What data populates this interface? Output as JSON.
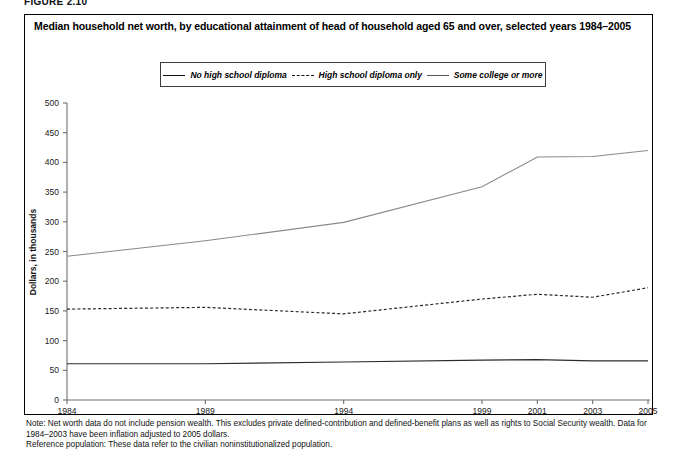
{
  "figure": {
    "label": "FIGURE 2.10"
  },
  "header": {
    "title": "Median household net worth, by educational attainment of head of household aged 65 and over, selected years 1984–2005"
  },
  "legend": {
    "position": "top-center",
    "items": [
      {
        "label": "No high school diploma",
        "style": "solid",
        "color": "#2b2b2b",
        "icon": "line-solid-icon"
      },
      {
        "label": "High school diploma only",
        "style": "dashed",
        "color": "#2b2b2b",
        "icon": "line-dashed-icon"
      },
      {
        "label": "Some college or more",
        "style": "thin-solid",
        "color": "#8a8a8a",
        "icon": "line-thin-icon"
      }
    ]
  },
  "notes": {
    "note_line1": "Note: Net worth data do not include pension wealth. This excludes private defined-contribution and defined-benefit plans as well as rights to Social Security wealth. Data for",
    "note_line2": "1984–2003 have been inflation adjusted to 2005 dollars.",
    "reference": "Reference population: These data refer to the civilian noninstitutionalized population."
  },
  "chart_data": {
    "type": "line",
    "title": "Median household net worth, by educational attainment of head of household aged 65 and over, selected years 1984–2005",
    "xlabel": "",
    "ylabel": "Dollars, in thousands",
    "x": [
      1984,
      1989,
      1994,
      1999,
      2001,
      2003,
      2005
    ],
    "xtick_labels": [
      "1984",
      "1989",
      "1994",
      "1999",
      "2001",
      "2003",
      "2005"
    ],
    "xlim": [
      1984,
      2005
    ],
    "ylim": [
      0,
      500
    ],
    "yticks": [
      0,
      50,
      100,
      150,
      200,
      250,
      300,
      350,
      400,
      450,
      500
    ],
    "ytick_labels": [
      "0",
      "50",
      "100",
      "150",
      "200",
      "250",
      "300",
      "350",
      "400",
      "450",
      "500"
    ],
    "grid": false,
    "legend_position": "top-center",
    "series": [
      {
        "name": "No high school diploma",
        "style": "solid",
        "color": "#2b2b2b",
        "values": [
          61,
          61,
          64,
          67,
          68,
          66,
          66
        ]
      },
      {
        "name": "High school diploma only",
        "style": "dashed",
        "color": "#2b2b2b",
        "values": [
          153,
          156,
          145,
          170,
          178,
          173,
          189
        ]
      },
      {
        "name": "Some college or more",
        "style": "thin-solid",
        "color": "#8a8a8a",
        "values": [
          242,
          268,
          299,
          359,
          409,
          410,
          420
        ]
      }
    ]
  }
}
